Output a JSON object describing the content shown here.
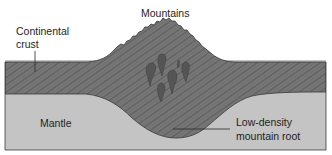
{
  "diagram": {
    "labels": {
      "mountains": "Mountains",
      "crust_line1": "Continental",
      "crust_line2": "crust",
      "mantle": "Mantle",
      "root_line1": "Low-density",
      "root_line2": "mountain root"
    },
    "colors": {
      "crust": "#7a7a7a",
      "crust_stripe": "#4a4a4a",
      "mantle": "#c4c4c4",
      "outline": "#3a3a3a",
      "blob": "#555555",
      "text": "#1e1e1e",
      "background": "#ffffff"
    },
    "layers": [
      {
        "name": "Continental crust",
        "pattern": "diagonal striations"
      },
      {
        "name": "Mantle",
        "pattern": "solid light gray"
      }
    ],
    "features": [
      {
        "name": "Mountains",
        "type": "peak"
      },
      {
        "name": "Low-density mountain root",
        "type": "crustal root"
      },
      {
        "name": "magma blobs",
        "count": 6
      }
    ]
  }
}
